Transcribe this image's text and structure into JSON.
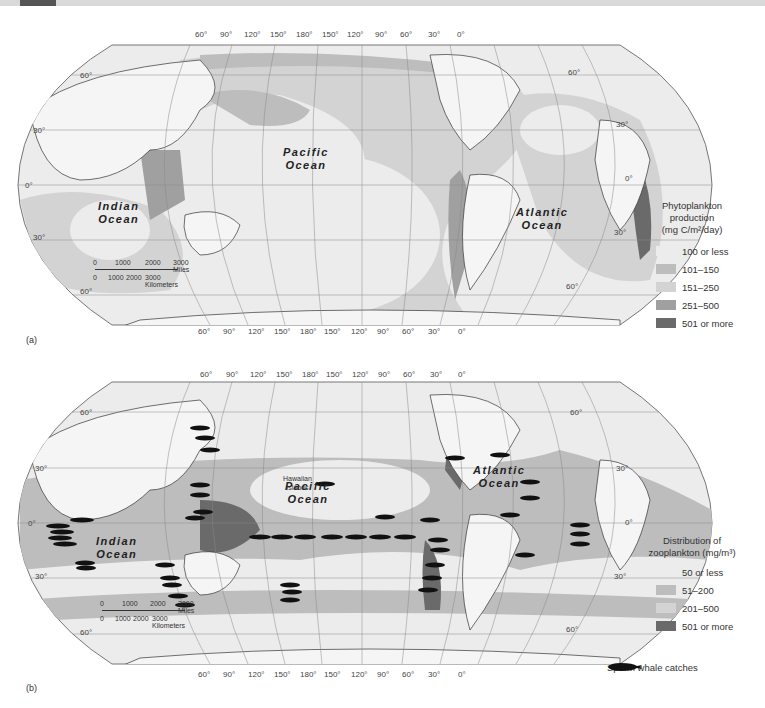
{
  "header_bar": {
    "accent_color": "#555555",
    "bar_color": "#d9d9d9"
  },
  "panel_a": {
    "label": "(a)",
    "top_longitudes": [
      "60°",
      "90°",
      "120°",
      "150°",
      "180°",
      "150°",
      "120°",
      "90°",
      "60°",
      "30°",
      "0°"
    ],
    "bottom_longitudes": [
      "60°",
      "90°",
      "120°",
      "150°",
      "180°",
      "150°",
      "120°",
      "90°",
      "60°",
      "30°",
      "0°"
    ],
    "left_latitudes": [
      "60°",
      "30°",
      "0°",
      "30°",
      "60°"
    ],
    "right_latitudes": [
      "60°",
      "30°",
      "0°",
      "30°",
      "60°"
    ],
    "oceans": [
      {
        "name": "Indian",
        "word2": "Ocean"
      },
      {
        "name": "Pacific",
        "word2": "Ocean"
      },
      {
        "name": "Atlantic",
        "word2": "Ocean"
      }
    ],
    "scale_bar": {
      "miles": [
        "0",
        "1000",
        "2000",
        "3000 Miles"
      ],
      "kilometers": [
        "0",
        "1000",
        "2000",
        "3000 Kilometers"
      ]
    },
    "legend": {
      "title_line1": "Phytoplankton",
      "title_line2": "production",
      "title_line3": "(mg C/m²/day)",
      "items": [
        {
          "label": "100 or less",
          "color": "#ececec"
        },
        {
          "label": "101–150",
          "color": "#bdbdbd"
        },
        {
          "label": "151–250",
          "color": "#d3d3d3"
        },
        {
          "label": "251–500",
          "color": "#a0a0a0"
        },
        {
          "label": "501 or more",
          "color": "#6a6a6a"
        }
      ]
    }
  },
  "panel_b": {
    "label": "(b)",
    "top_longitudes": [
      "60°",
      "90°",
      "120°",
      "150°",
      "180°",
      "150°",
      "120°",
      "90°",
      "60°",
      "30°",
      "0°"
    ],
    "bottom_longitudes": [
      "60°",
      "90°",
      "120°",
      "150°",
      "180°",
      "150°",
      "120°",
      "90°",
      "60°",
      "30°",
      "0°"
    ],
    "left_latitudes": [
      "60°",
      "30°",
      "0°",
      "30°",
      "60°"
    ],
    "right_latitudes": [
      "60°",
      "30°",
      "0°",
      "30°",
      "60°"
    ],
    "oceans": [
      {
        "name": "Indian",
        "word2": "Ocean"
      },
      {
        "name": "Pacific",
        "word2": "Ocean"
      },
      {
        "name": "Atlantic",
        "word2": "Ocean"
      }
    ],
    "place_label_line1": "Hawaiian",
    "place_label_line2": "Islands",
    "scale_bar": {
      "miles": [
        "0",
        "1000",
        "2000",
        "3000 Miles"
      ],
      "kilometers": [
        "0",
        "1000",
        "2000",
        "3000 Kilometers"
      ]
    },
    "legend": {
      "title_line1": "Distribution of",
      "title_line2": "zooplankton (mg/m³)",
      "items": [
        {
          "label": "50 or less",
          "color": "#ececec"
        },
        {
          "label": "51–200",
          "color": "#bdbdbd"
        },
        {
          "label": "201–500",
          "color": "#d3d3d3"
        },
        {
          "label": "501 or more",
          "color": "#6a6a6a"
        }
      ]
    },
    "whale_legend": {
      "label": "Sperm whale catches",
      "icon": "sperm-whale-icon"
    }
  }
}
